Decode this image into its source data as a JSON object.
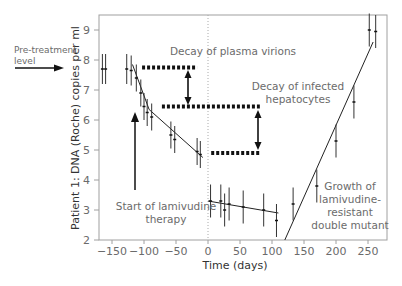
{
  "chart_data": {
    "type": "scatter",
    "title": "",
    "xlabel": "Time (days)",
    "ylabel": "Patient 1: DNA (Roche) copies per ml",
    "xlim": [
      -170,
      280
    ],
    "ylim": [
      2,
      9.5
    ],
    "x_ticks": [
      -150,
      -100,
      -50,
      0,
      50,
      100,
      150,
      200,
      250
    ],
    "y_ticks": [
      2,
      3,
      4,
      5,
      6,
      7,
      8,
      9
    ],
    "grid": false,
    "legend": null,
    "points": [
      {
        "x": -165,
        "y": 7.7,
        "err": 0.5
      },
      {
        "x": -160,
        "y": 7.7,
        "err": 0.5
      },
      {
        "x": -127,
        "y": 7.7,
        "err": 0.5
      },
      {
        "x": -120,
        "y": 7.65,
        "err": 0.5
      },
      {
        "x": -112,
        "y": 7.4,
        "err": 0.45
      },
      {
        "x": -105,
        "y": 6.9,
        "err": 0.45
      },
      {
        "x": -100,
        "y": 6.45,
        "err": 0.45
      },
      {
        "x": -95,
        "y": 6.25,
        "err": 0.45
      },
      {
        "x": -88,
        "y": 6.1,
        "err": 0.45
      },
      {
        "x": -58,
        "y": 5.5,
        "err": 0.45
      },
      {
        "x": -52,
        "y": 5.35,
        "err": 0.45
      },
      {
        "x": -17,
        "y": 4.95,
        "err": 0.45
      },
      {
        "x": -12,
        "y": 4.85,
        "err": 0.45
      },
      {
        "x": 4,
        "y": 3.3,
        "err": 0.55
      },
      {
        "x": 20,
        "y": 3.3,
        "err": 0.55
      },
      {
        "x": 26,
        "y": 3.0,
        "err": 0.55
      },
      {
        "x": 33,
        "y": 3.2,
        "err": 0.55
      },
      {
        "x": 55,
        "y": 3.1,
        "err": 0.55
      },
      {
        "x": 87,
        "y": 3.0,
        "err": 0.55
      },
      {
        "x": 107,
        "y": 2.65,
        "err": 0.55
      },
      {
        "x": 133,
        "y": 3.2,
        "err": 0.55
      },
      {
        "x": 170,
        "y": 3.8,
        "err": 0.55
      },
      {
        "x": 200,
        "y": 5.3,
        "err": 0.55
      },
      {
        "x": 228,
        "y": 6.6,
        "err": 0.55
      },
      {
        "x": 252,
        "y": 9.0,
        "err": 0.55
      },
      {
        "x": 262,
        "y": 8.95,
        "err": 0.55
      }
    ],
    "fit_lines": [
      {
        "name": "decay of plasma virions",
        "from": [
          -118,
          7.85
        ],
        "to": [
          -92,
          6.35
        ]
      },
      {
        "name": "decay of infected hepatocytes",
        "from": [
          -92,
          6.35
        ],
        "to": [
          -8,
          4.75
        ]
      },
      {
        "name": "post-treatment plateau",
        "from": [
          0,
          3.3
        ],
        "to": [
          110,
          2.9
        ]
      },
      {
        "name": "growth of lamivudine-resistant double mutant",
        "from": [
          120,
          2.0
        ],
        "to": [
          258,
          8.6
        ]
      }
    ],
    "dashed_levels": [
      {
        "y": 7.75,
        "x_from": -103,
        "x_to": -17
      },
      {
        "y": 6.45,
        "x_from": -72,
        "x_to": 81
      },
      {
        "y": 4.9,
        "x_from": 5,
        "x_to": 80
      }
    ],
    "vertical_reference": {
      "x": 0,
      "style": "dotted"
    },
    "annotations": [
      {
        "text": "Pre-treatment level",
        "position": "left, pointing to y=7.75"
      },
      {
        "text": "Decay of plasma virions",
        "position": "top center"
      },
      {
        "text": "Decay of infected hepatocytes",
        "position": "upper right"
      },
      {
        "text": "Start of lamivudine therapy",
        "position": "lower left, arrow up at x=-115"
      },
      {
        "text": "Growth of lamivudine-resistant double mutant",
        "position": "lower right"
      }
    ]
  },
  "labels": {
    "pretreatment_line1": "Pre-treatment",
    "pretreatment_line2": "level",
    "plasma_decay": "Decay of plasma virions",
    "hepatocyte_line1": "Decay of infected",
    "hepatocyte_line2": "hepatocytes",
    "start_line1": "Start of lamivudine",
    "start_line2": "therapy",
    "growth_line1": "Growth of",
    "growth_line2": "lamivudine-",
    "growth_line3": "resistant",
    "growth_line4": "double mutant",
    "xlabel": "Time (days)",
    "ylabel": "Patient 1: DNA (Roche) copies per ml"
  },
  "colors": {
    "axis": "#999999",
    "data": "#222222",
    "text": "#6b6b6b",
    "dotted_reference": "#aaaaaa"
  }
}
